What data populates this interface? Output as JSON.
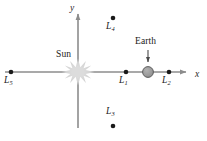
{
  "figure": {
    "width": 207,
    "height": 141,
    "background_color": "#ffffff"
  },
  "axes": {
    "x": {
      "label": "x",
      "color": "#8c8c8c",
      "y_pixel": 72,
      "start_x": 5,
      "end_x": 193,
      "arrow": "right",
      "label_pos": [
        195,
        74
      ]
    },
    "y": {
      "label": "y",
      "color": "#8c8c8c",
      "x_pixel": 78,
      "start_y": 128,
      "end_y": 8,
      "arrow": "up",
      "label_pos": [
        70,
        6
      ]
    }
  },
  "bodies": [
    {
      "name": "Sun",
      "label": "Sun",
      "glyph": "starburst",
      "color": "#d2d2d2",
      "cx": 78,
      "cy": 72,
      "radius": 11,
      "label_pos": [
        56,
        51
      ]
    },
    {
      "name": "Earth",
      "label": "Earth",
      "glyph": "filled-circle",
      "color": "#9a9a9a",
      "border_color": "#5e5e5e",
      "cx": 148,
      "cy": 72,
      "radius": 5.5,
      "label_pos": [
        136,
        37
      ],
      "pointer": {
        "from": [
          148,
          51
        ],
        "to": [
          148,
          64
        ]
      }
    }
  ],
  "lagrange_points": [
    {
      "id": "L1",
      "letter": "L",
      "index": "1",
      "cx": 126,
      "cy": 72,
      "label_pos": [
        120,
        76
      ],
      "label_side": "below",
      "color": "#1a1a1a"
    },
    {
      "id": "L2",
      "letter": "L",
      "index": "2",
      "cx": 169,
      "cy": 72,
      "label_pos": [
        163,
        76
      ],
      "label_side": "below",
      "color": "#1a1a1a"
    },
    {
      "id": "L3",
      "letter": "L",
      "index": "3",
      "cx": 113,
      "cy": 126,
      "label_pos": [
        107,
        108
      ],
      "label_side": "above",
      "color": "#1a1a1a"
    },
    {
      "id": "L4",
      "letter": "L",
      "index": "4",
      "cx": 113,
      "cy": 18,
      "label_pos": [
        107,
        22
      ],
      "label_side": "below",
      "color": "#1a1a1a"
    },
    {
      "id": "L5",
      "letter": "L",
      "index": "5",
      "cx": 11,
      "cy": 72,
      "label_pos": [
        5,
        76
      ],
      "label_side": "below",
      "color": "#1a1a1a"
    }
  ],
  "colors": {
    "axis": "#8c8c8c",
    "point": "#1a1a1a",
    "sun": "#d2d2d2",
    "earth_fill": "#9a9a9a",
    "earth_stroke": "#5e5e5e",
    "text": "#1a1a1a",
    "background": "#ffffff"
  }
}
